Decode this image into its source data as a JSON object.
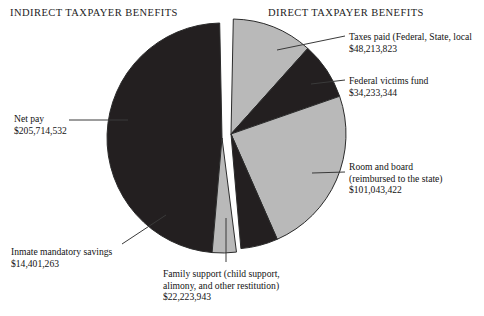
{
  "headers": {
    "indirect": "INDIRECT TAXPAYER BENEFITS",
    "direct": "DIRECT TAXPAYER BENEFITS"
  },
  "labels": {
    "taxes": {
      "line1": "Taxes paid (Federal, State, local",
      "amount": "$48,213,823"
    },
    "victims": {
      "line1": "Federal victims fund",
      "amount": "$34,233,344"
    },
    "room": {
      "line1": "Room and board",
      "line2": "(reimbursed to the state)",
      "amount": "$101,043,422"
    },
    "netpay": {
      "line1": "Net pay",
      "amount": "$205,714,532"
    },
    "savings": {
      "line1": "Inmate mandatory savings",
      "amount": "$14,401,263"
    },
    "family": {
      "line1": "Family support (child support,",
      "line2": "alimony, and other restitution)",
      "amount": "$22,223,943"
    }
  },
  "colors": {
    "dark": "#231f20",
    "light": "#b9b9b9",
    "outline": "#2b2b2b",
    "background": "#ffffff",
    "leader": "#3a3a3a",
    "text": "#131313"
  },
  "chart_data": {
    "type": "pie",
    "title": "",
    "legend_position": "callouts",
    "groups": [
      {
        "name": "INDIRECT TAXPAYER BENEFITS",
        "side": "left"
      },
      {
        "name": "DIRECT TAXPAYER BENEFITS",
        "side": "right"
      }
    ],
    "categories": [
      "Taxes paid (Federal, State, local",
      "Federal victims fund",
      "Room and board (reimbursed to the state)",
      "Family support (child support, alimony, and other restitution)",
      "Inmate mandatory savings",
      "Net pay"
    ],
    "values": [
      48213823,
      34233344,
      101043422,
      22223943,
      14401263,
      205714532
    ],
    "value_labels": [
      "$48,213,823",
      "$34,233,344",
      "$101,043,422",
      "$22,223,943",
      "$14,401,263",
      "$205,714,532"
    ],
    "group_of_slice": [
      "direct",
      "direct",
      "direct",
      "direct",
      "indirect",
      "indirect"
    ],
    "slice_fills": [
      "light",
      "dark",
      "light",
      "dark",
      "light",
      "dark"
    ],
    "total": 425830327,
    "units": "US dollars",
    "exploded": true,
    "explode_axis": "vertical-split-between-direct-and-indirect"
  }
}
